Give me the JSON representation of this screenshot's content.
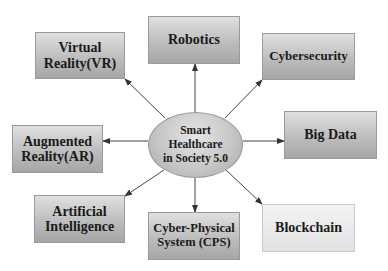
{
  "diagram": {
    "title": "Smart Healthcare in Society 5.0",
    "hub": {
      "label": "Smart\nHealthcare\nin Society 5.0"
    },
    "nodes": [
      {
        "id": "vr",
        "label": "Virtual\nReality(VR)"
      },
      {
        "id": "robotics",
        "label": "Robotics"
      },
      {
        "id": "cybersecurity",
        "label": "Cybersecurity"
      },
      {
        "id": "bigdata",
        "label": "Big Data"
      },
      {
        "id": "ar",
        "label": "Augmented\nReality(AR)"
      },
      {
        "id": "ai",
        "label": "Artificial\nIntelligence"
      },
      {
        "id": "cps",
        "label": "Cyber-Physical\nSystem (CPS)"
      },
      {
        "id": "blockchain",
        "label": "Blockchain"
      }
    ],
    "edges": [
      {
        "from": "hub",
        "to": "vr"
      },
      {
        "from": "hub",
        "to": "robotics"
      },
      {
        "from": "hub",
        "to": "cybersecurity"
      },
      {
        "from": "hub",
        "to": "bigdata"
      },
      {
        "from": "hub",
        "to": "ar"
      },
      {
        "from": "hub",
        "to": "ai"
      },
      {
        "from": "hub",
        "to": "cps"
      },
      {
        "from": "hub",
        "to": "blockchain"
      }
    ],
    "colors": {
      "box_dark": "#b5b5b5",
      "box_light": "#e8e8e8",
      "arrow": "#333333",
      "text": "#1a1a1a"
    }
  }
}
